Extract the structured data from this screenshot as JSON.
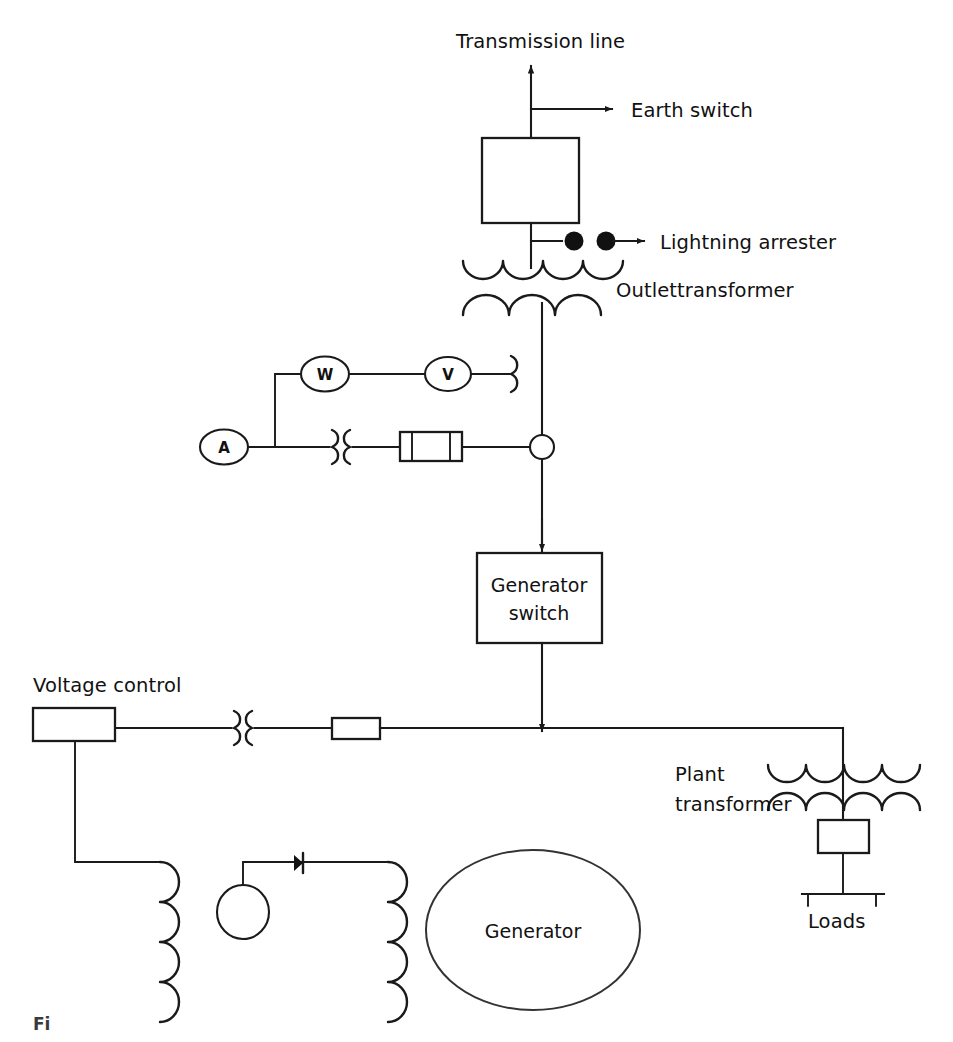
{
  "figure": {
    "type": "single-line-diagram",
    "domain": "electrical power plant",
    "caption_fragment": "Fi",
    "background_color": "#ffffff",
    "line_color": "#1a1a1a"
  },
  "labels": {
    "transmission_line": "Transmission line",
    "earth_switch": "Earth switch",
    "lightning_arrester": "Lightning arrester",
    "outlet_transformer": "Outlettransformer",
    "generator_switch_line1": "Generator",
    "generator_switch_line2": "switch",
    "voltage_control": "Voltage control",
    "plant_transformer_line1": "Plant",
    "plant_transformer_line2": "transformer",
    "loads": "Loads",
    "generator": "Generator"
  },
  "meters": {
    "wattmeter": "W",
    "voltmeter": "V",
    "ammeter": "A"
  },
  "components": [
    {
      "id": "transmission-line-arrow",
      "kind": "arrow",
      "label": "Transmission line"
    },
    {
      "id": "earth-switch-arrow",
      "kind": "arrow",
      "label": "Earth switch"
    },
    {
      "id": "main-breaker",
      "kind": "box",
      "label": ""
    },
    {
      "id": "lightning-arrester",
      "kind": "spark-gap",
      "label": "Lightning arrester"
    },
    {
      "id": "outlet-transformer",
      "kind": "transformer",
      "label": "Outlettransformer"
    },
    {
      "id": "wattmeter",
      "kind": "meter",
      "label": "W"
    },
    {
      "id": "voltmeter",
      "kind": "meter",
      "label": "V"
    },
    {
      "id": "ammeter",
      "kind": "meter",
      "label": "A"
    },
    {
      "id": "voltage-transformer",
      "kind": "instrument-transformer",
      "label": ""
    },
    {
      "id": "current-transformer",
      "kind": "instrument-transformer",
      "label": ""
    },
    {
      "id": "metering-fuse",
      "kind": "fuse",
      "label": ""
    },
    {
      "id": "generator-switch",
      "kind": "box",
      "label": "Generator switch"
    },
    {
      "id": "voltage-control",
      "kind": "box",
      "label": "Voltage control"
    },
    {
      "id": "excitation-ct",
      "kind": "instrument-transformer",
      "label": ""
    },
    {
      "id": "excitation-resistor",
      "kind": "resistor",
      "label": ""
    },
    {
      "id": "exciter",
      "kind": "circle",
      "label": ""
    },
    {
      "id": "rectifier-diode",
      "kind": "diode",
      "label": ""
    },
    {
      "id": "field-winding-left",
      "kind": "coil",
      "label": ""
    },
    {
      "id": "field-winding-right",
      "kind": "coil",
      "label": ""
    },
    {
      "id": "generator",
      "kind": "ellipse",
      "label": "Generator"
    },
    {
      "id": "plant-transformer",
      "kind": "transformer",
      "label": "Plant transformer"
    },
    {
      "id": "loads-switch",
      "kind": "box",
      "label": ""
    },
    {
      "id": "loads-busbar",
      "kind": "busbar",
      "label": "Loads"
    }
  ]
}
